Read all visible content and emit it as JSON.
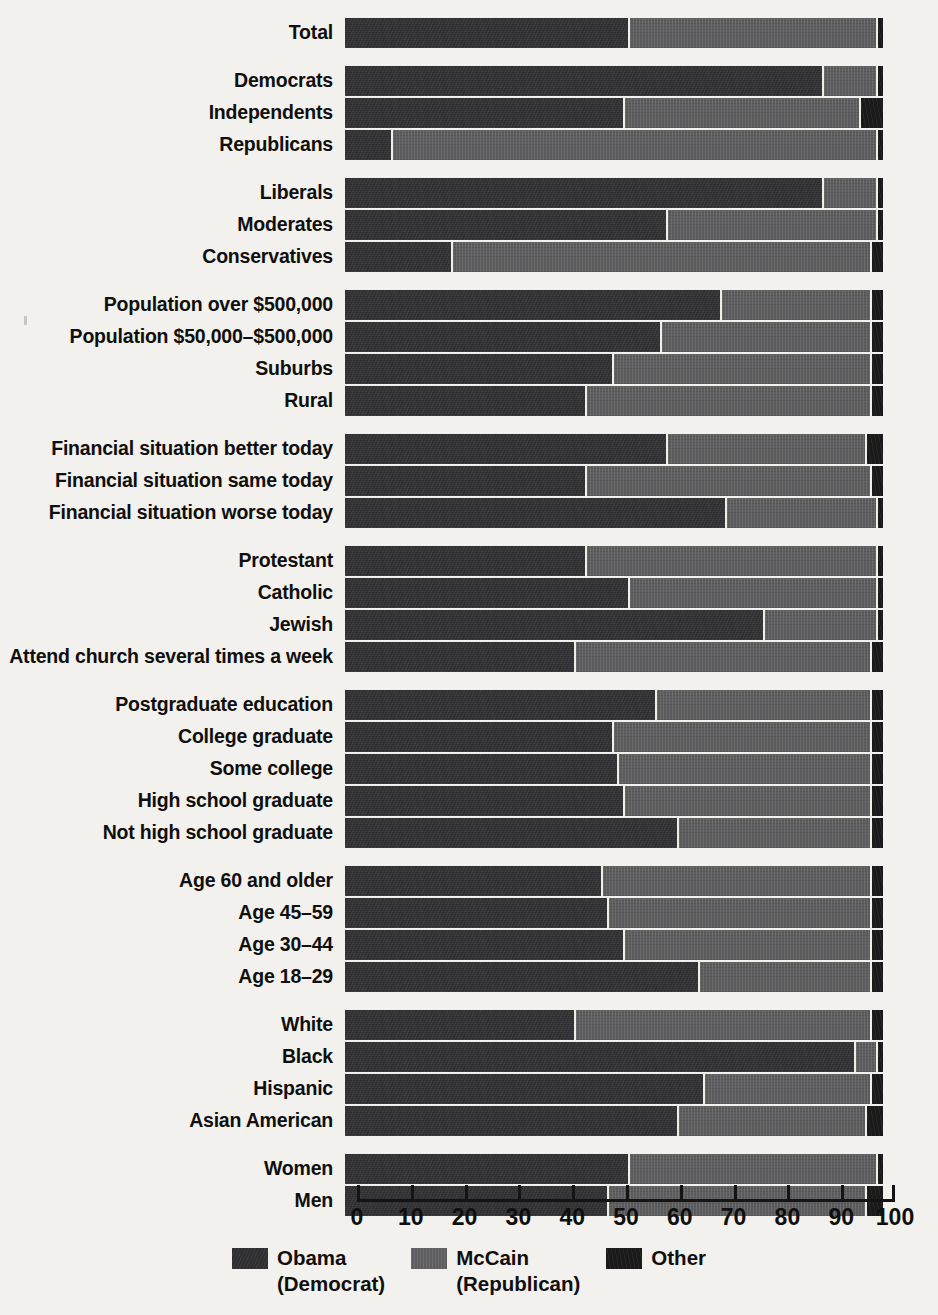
{
  "chart_data": {
    "type": "bar",
    "subtype": "stacked-horizontal-100pct",
    "title": "",
    "xlabel": "",
    "ylabel": "",
    "xlim": [
      0,
      100
    ],
    "xticks": [
      0,
      10,
      20,
      30,
      40,
      50,
      60,
      70,
      80,
      90,
      100
    ],
    "grid": false,
    "legend_position": "bottom-center",
    "series": [
      {
        "name": "Obama",
        "sub": "(Democrat)",
        "color": "#2f2f31"
      },
      {
        "name": "McCain",
        "sub": "(Republican)",
        "color": "#5d5c5e"
      },
      {
        "name": "Other",
        "sub": "",
        "color": "#1a1a1b"
      }
    ],
    "groups": [
      {
        "id": "total",
        "rows": [
          {
            "label": "Total",
            "obama": 53,
            "mccain": 46,
            "other": 1
          }
        ]
      },
      {
        "id": "party",
        "rows": [
          {
            "label": "Democrats",
            "obama": 89,
            "mccain": 10,
            "other": 1
          },
          {
            "label": "Independents",
            "obama": 52,
            "mccain": 44,
            "other": 4
          },
          {
            "label": "Republicans",
            "obama": 9,
            "mccain": 90,
            "other": 1
          }
        ]
      },
      {
        "id": "ideology",
        "rows": [
          {
            "label": "Liberals",
            "obama": 89,
            "mccain": 10,
            "other": 1
          },
          {
            "label": "Moderates",
            "obama": 60,
            "mccain": 39,
            "other": 1
          },
          {
            "label": "Conservatives",
            "obama": 20,
            "mccain": 78,
            "other": 2
          }
        ]
      },
      {
        "id": "community",
        "rows": [
          {
            "label": "Population over $500,000",
            "obama": 70,
            "mccain": 28,
            "other": 2
          },
          {
            "label": "Population $50,000–$500,000",
            "obama": 59,
            "mccain": 39,
            "other": 2
          },
          {
            "label": "Suburbs",
            "obama": 50,
            "mccain": 48,
            "other": 2
          },
          {
            "label": "Rural",
            "obama": 45,
            "mccain": 53,
            "other": 2
          }
        ]
      },
      {
        "id": "finances",
        "rows": [
          {
            "label": "Financial situation better today",
            "obama": 60,
            "mccain": 37,
            "other": 3
          },
          {
            "label": "Financial situation same today",
            "obama": 45,
            "mccain": 53,
            "other": 2
          },
          {
            "label": "Financial situation worse today",
            "obama": 71,
            "mccain": 28,
            "other": 1
          }
        ]
      },
      {
        "id": "religion",
        "rows": [
          {
            "label": "Protestant",
            "obama": 45,
            "mccain": 54,
            "other": 1
          },
          {
            "label": "Catholic",
            "obama": 53,
            "mccain": 46,
            "other": 1
          },
          {
            "label": "Jewish",
            "obama": 78,
            "mccain": 21,
            "other": 1
          },
          {
            "label": "Attend church several times a week",
            "obama": 43,
            "mccain": 55,
            "other": 2
          }
        ]
      },
      {
        "id": "education",
        "rows": [
          {
            "label": "Postgraduate education",
            "obama": 58,
            "mccain": 40,
            "other": 2
          },
          {
            "label": "College graduate",
            "obama": 50,
            "mccain": 48,
            "other": 2
          },
          {
            "label": "Some college",
            "obama": 51,
            "mccain": 47,
            "other": 2
          },
          {
            "label": "High school graduate",
            "obama": 52,
            "mccain": 46,
            "other": 2
          },
          {
            "label": "Not high school graduate",
            "obama": 62,
            "mccain": 36,
            "other": 2
          }
        ]
      },
      {
        "id": "age",
        "rows": [
          {
            "label": "Age 60 and older",
            "obama": 48,
            "mccain": 50,
            "other": 2
          },
          {
            "label": "Age 45–59",
            "obama": 49,
            "mccain": 49,
            "other": 2
          },
          {
            "label": "Age 30–44",
            "obama": 52,
            "mccain": 46,
            "other": 2
          },
          {
            "label": "Age 18–29",
            "obama": 66,
            "mccain": 32,
            "other": 2
          }
        ]
      },
      {
        "id": "race",
        "rows": [
          {
            "label": "White",
            "obama": 43,
            "mccain": 55,
            "other": 2
          },
          {
            "label": "Black",
            "obama": 95,
            "mccain": 4,
            "other": 1
          },
          {
            "label": "Hispanic",
            "obama": 67,
            "mccain": 31,
            "other": 2
          },
          {
            "label": "Asian American",
            "obama": 62,
            "mccain": 35,
            "other": 3
          }
        ]
      },
      {
        "id": "gender",
        "rows": [
          {
            "label": "Women",
            "obama": 53,
            "mccain": 46,
            "other": 1
          },
          {
            "label": "Men",
            "obama": 49,
            "mccain": 48,
            "other": 3
          }
        ]
      }
    ]
  },
  "axis": {
    "tick_labels": [
      "0",
      "10",
      "20",
      "30",
      "40",
      "50",
      "60",
      "70",
      "80",
      "90",
      "100"
    ]
  },
  "legend": {
    "items": [
      {
        "label": "Obama",
        "sub": "(Democrat)"
      },
      {
        "label": "McCain",
        "sub": "(Republican)"
      },
      {
        "label": "Other",
        "sub": ""
      }
    ]
  }
}
